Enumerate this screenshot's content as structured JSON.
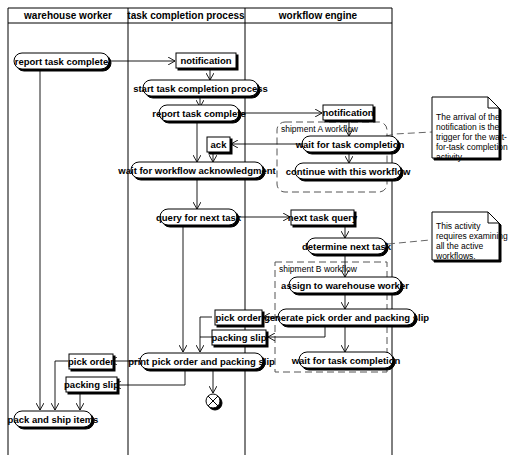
{
  "diagram": {
    "type": "UML activity diagram with swimlanes",
    "lanes": [
      {
        "id": "warehouse_worker",
        "label": "warehouse worker"
      },
      {
        "id": "task_completion_process",
        "label": "task completion process"
      },
      {
        "id": "workflow_engine",
        "label": "workflow engine"
      }
    ],
    "activities": [
      {
        "id": "a1",
        "label": "report task complete",
        "lane": "warehouse_worker"
      },
      {
        "id": "a2",
        "label": "start task completion process",
        "lane": "task_completion_process"
      },
      {
        "id": "a3",
        "label": "report task complete",
        "lane": "task_completion_process"
      },
      {
        "id": "a4",
        "label": "wait for workflow acknowledgment",
        "lane": "task_completion_process"
      },
      {
        "id": "a5",
        "label": "query for next task",
        "lane": "task_completion_process"
      },
      {
        "id": "a6",
        "label": "print pick order and packing slip",
        "lane": "task_completion_process"
      },
      {
        "id": "a7",
        "label": "wait for task completion",
        "lane": "workflow_engine"
      },
      {
        "id": "a8",
        "label": "continue with this workflow",
        "lane": "workflow_engine"
      },
      {
        "id": "a9",
        "label": "determine next task",
        "lane": "workflow_engine"
      },
      {
        "id": "a10",
        "label": "assign to warehouse worker",
        "lane": "workflow_engine"
      },
      {
        "id": "a11",
        "label": "generate pick order and packing slip",
        "lane": "workflow_engine"
      },
      {
        "id": "a12",
        "label": "wait for task completion",
        "lane": "workflow_engine"
      },
      {
        "id": "a13",
        "label": "pack and ship items",
        "lane": "warehouse_worker"
      }
    ],
    "objects": [
      {
        "id": "o1",
        "label": "notification",
        "lane": "task_completion_process"
      },
      {
        "id": "o2",
        "label": "notification",
        "lane": "workflow_engine"
      },
      {
        "id": "o3",
        "label": "ack",
        "lane": "task_completion_process"
      },
      {
        "id": "o4",
        "label": "next task query",
        "lane": "workflow_engine"
      },
      {
        "id": "o5",
        "label": "pick order",
        "lane": "task_completion_process"
      },
      {
        "id": "o6",
        "label": "packing slip",
        "lane": "task_completion_process"
      },
      {
        "id": "o7",
        "label": "pick order",
        "lane": "warehouse_worker"
      },
      {
        "id": "o8",
        "label": "packing slip",
        "lane": "warehouse_worker"
      }
    ],
    "regions": [
      {
        "id": "r1",
        "label": "shipment A workflow"
      },
      {
        "id": "r2",
        "label": "shipment B workflow"
      }
    ],
    "notes": [
      {
        "id": "n1",
        "lines": [
          "The arrival of the",
          "notification is the",
          "trigger for the wait-",
          "for-task completion",
          "activity."
        ]
      },
      {
        "id": "n2",
        "lines": [
          "This activity",
          "requires examining",
          "all the active",
          "workflows."
        ]
      }
    ],
    "final_node": {
      "id": "end",
      "type": "flow-final"
    }
  }
}
